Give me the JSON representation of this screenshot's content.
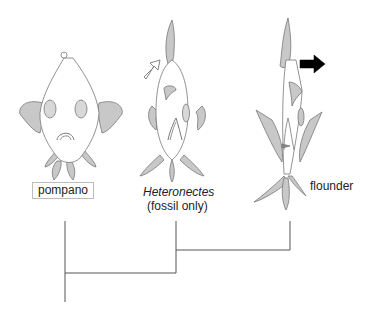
{
  "diagram": {
    "type": "cladogram",
    "taxa": [
      {
        "id": "pompano",
        "label": "pompano",
        "boxed": true,
        "italic": false,
        "subtitle": ""
      },
      {
        "id": "heteronectes",
        "label": "Heteronectes",
        "boxed": false,
        "italic": true,
        "subtitle": "(fossil only)"
      },
      {
        "id": "flounder",
        "label": "flounder",
        "boxed": false,
        "italic": false,
        "subtitle": ""
      }
    ],
    "arrows": [
      {
        "near": "heteronectes",
        "style": "outline",
        "direction": "up-right"
      },
      {
        "near": "flounder",
        "style": "solid",
        "direction": "right"
      }
    ],
    "tree": {
      "topology": "(pompano,(heteronectes,flounder))"
    },
    "colors": {
      "fin_fill": "#c8c8c8",
      "outline": "#777777",
      "arrow_solid": "#000000",
      "tree_line": "#555555"
    }
  }
}
